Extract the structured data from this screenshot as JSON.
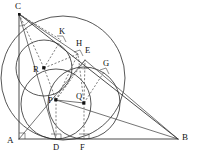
{
  "figure": {
    "canvas": {
      "width": 199,
      "height": 160
    },
    "background_color": "#ffffff",
    "line_color": "#2b2b2b",
    "dashed_color": "#4a4a4a",
    "label_color": "#111111"
  },
  "labels": {
    "C": "C",
    "K": "K",
    "H": "H",
    "E": "E",
    "G": "G",
    "R": "R",
    "P": "P",
    "Q": "Q",
    "A": "A",
    "D": "D",
    "F": "F",
    "B": "B"
  },
  "points": [
    {
      "id": "C",
      "label": "C",
      "x": 19,
      "y": 14,
      "label_x": 16,
      "label_y": 3,
      "kind": "vertex"
    },
    {
      "id": "A",
      "label": "A",
      "x": 19,
      "y": 139,
      "label_x": 8,
      "label_y": 138,
      "kind": "vertex"
    },
    {
      "id": "B",
      "label": "B",
      "x": 178,
      "y": 139,
      "label_x": 183,
      "label_y": 134,
      "kind": "vertex"
    },
    {
      "id": "K",
      "label": "K",
      "x": 61,
      "y": 40,
      "label_x": 60,
      "label_y": 28,
      "kind": "tangency"
    },
    {
      "id": "H",
      "label": "H",
      "x": 78,
      "y": 54,
      "label_x": 77,
      "label_y": 40,
      "kind": "tangency"
    },
    {
      "id": "E",
      "label": "E",
      "x": 85,
      "y": 60,
      "label_x": 86,
      "label_y": 48,
      "kind": "tangency"
    },
    {
      "id": "G",
      "label": "G",
      "x": 104,
      "y": 72,
      "label_x": 104,
      "label_y": 60,
      "kind": "tangency"
    },
    {
      "id": "R",
      "label": "R",
      "x": 44,
      "y": 68,
      "label_x": 35,
      "label_y": 66,
      "kind": "center"
    },
    {
      "id": "P",
      "label": "P",
      "x": 56,
      "y": 100,
      "label_x": 50,
      "label_y": 97,
      "kind": "center"
    },
    {
      "id": "Q",
      "label": "Q",
      "x": 84,
      "y": 103,
      "label_x": 77,
      "label_y": 93,
      "kind": "center"
    },
    {
      "id": "D",
      "label": "D",
      "x": 56,
      "y": 139,
      "label_x": 54,
      "label_y": 143,
      "kind": "foot"
    },
    {
      "id": "F",
      "label": "F",
      "x": 84,
      "y": 139,
      "label_x": 81,
      "label_y": 143,
      "kind": "foot"
    }
  ],
  "segments": [
    {
      "id": "AB",
      "from": "A",
      "to": "B",
      "style": "solid"
    },
    {
      "id": "AC",
      "from": "A",
      "to": "C",
      "style": "solid"
    },
    {
      "id": "CB",
      "from": "C",
      "to": "B",
      "style": "solid"
    },
    {
      "id": "CD",
      "from": "C",
      "to": "D",
      "style": "solid"
    },
    {
      "id": "AE",
      "from": "A",
      "to": "E",
      "style": "solid"
    },
    {
      "id": "EB",
      "from": "E",
      "to": "B",
      "style": "solid"
    },
    {
      "id": "PB",
      "from": "P",
      "to": "B",
      "style": "solid"
    },
    {
      "id": "PQ",
      "from": "P",
      "to": "Q",
      "style": "solid"
    },
    {
      "id": "CK",
      "from": "C",
      "to": "K",
      "style": "dashed"
    },
    {
      "id": "CR",
      "from": "C",
      "to": "R",
      "style": "dashed"
    },
    {
      "id": "RK",
      "from": "R",
      "to": "K",
      "style": "dashed"
    },
    {
      "id": "RH",
      "from": "R",
      "to": "H",
      "style": "dashed"
    },
    {
      "id": "QE",
      "from": "Q",
      "to": "E",
      "style": "dashed"
    },
    {
      "id": "QG",
      "from": "Q",
      "to": "G",
      "style": "dashed"
    },
    {
      "id": "QF",
      "from": "Q",
      "to": "F",
      "style": "dashed"
    },
    {
      "id": "PD",
      "from": "P",
      "to": "D",
      "style": "dashed"
    },
    {
      "id": "PH",
      "from": "P",
      "to": "H",
      "style": "dashed"
    }
  ],
  "circles": [
    {
      "id": "circle-P",
      "center": "P",
      "cx": 56,
      "cy": 104,
      "r": 35,
      "note": "incircle tangent to AB at D"
    },
    {
      "id": "circle-Q",
      "center": "Q",
      "cx": 84,
      "cy": 103,
      "r": 36,
      "note": "circle tangent to AB at F"
    },
    {
      "id": "circle-R",
      "center": "R",
      "cx": 44,
      "cy": 68,
      "r": 28,
      "note": "circle tangent to CB at K"
    },
    {
      "id": "circle-big",
      "center": "",
      "cx": 63,
      "cy": 78,
      "r": 62,
      "note": "large circle through the configuration"
    }
  ],
  "right_angle_marks": [
    {
      "id": "right-angle-A",
      "x": 19,
      "y": 139,
      "note": "angle at A"
    },
    {
      "id": "right-angle-D",
      "x": 56,
      "y": 139,
      "note": "PD perpendicular to AB"
    },
    {
      "id": "right-angle-F",
      "x": 84,
      "y": 139,
      "note": "QF perpendicular to AB"
    },
    {
      "id": "right-angle-K",
      "x": 61,
      "y": 40,
      "note": "RK perpendicular to CB"
    },
    {
      "id": "right-angle-H",
      "x": 78,
      "y": 54,
      "note": "tangent mark at H"
    },
    {
      "id": "right-angle-G",
      "x": 104,
      "y": 72,
      "note": "QG perpendicular to CB"
    }
  ]
}
